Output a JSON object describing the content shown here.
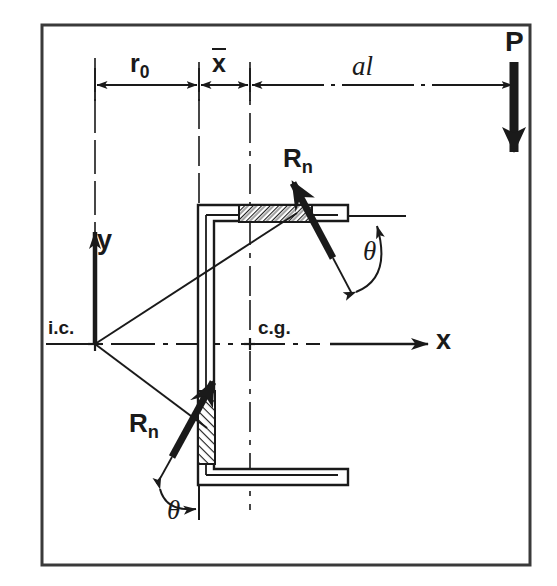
{
  "figure": {
    "kind": "engineering-diagram",
    "ink_color": "#1a1a1a",
    "background_color": "#ffffff",
    "border_color": "#3a3a3a"
  },
  "labels": {
    "r0": {
      "base": "r",
      "subscript": "0",
      "text": "r0"
    },
    "xbar": {
      "base": "x",
      "accent": "overbar",
      "text": "x"
    },
    "al": "al",
    "load_P": "P",
    "axis_y": "y",
    "axis_x": "x",
    "instant_center": "i.c.",
    "center_gravity": "c.g.",
    "weld_force_top": {
      "base": "R",
      "subscript": "n",
      "text": "Rn"
    },
    "weld_force_bottom": {
      "base": "R",
      "subscript": "n",
      "text": "Rn"
    },
    "theta_top": "θ",
    "theta_bottom": "θ"
  },
  "dimensions": {
    "chain": [
      {
        "name": "r0",
        "from_x": 95,
        "to_x": 199,
        "label": "r0"
      },
      {
        "name": "xbar",
        "from_x": 199,
        "to_x": 250,
        "label": "x"
      },
      {
        "name": "al",
        "from_x": 250,
        "to_x": 514,
        "label": "al"
      }
    ],
    "dimension_line_y": 85
  },
  "geometry": {
    "border": {
      "x": 42,
      "y": 25,
      "width": 488,
      "height": 540
    },
    "instant_center_point": {
      "x": 95,
      "y": 344
    },
    "center_gravity_point": {
      "x": 250,
      "y": 344
    },
    "x_axis_y": 344,
    "load_P_x": 514,
    "angle_section": {
      "vertical_leg": {
        "x1": 198,
        "x2": 214,
        "y1": 205,
        "y2": 485
      },
      "top_leg": {
        "x1": 198,
        "x2": 348,
        "y1": 205,
        "y2": 221
      },
      "bottom_leg": {
        "x1": 198,
        "x2": 348,
        "y1": 469,
        "y2": 485
      }
    },
    "welds": [
      {
        "id": "weld-top",
        "x": 238,
        "y": 205,
        "width": 74,
        "height": 17
      },
      {
        "id": "weld-bottom",
        "x": 198,
        "y": 390,
        "width": 17,
        "height": 74
      }
    ]
  }
}
